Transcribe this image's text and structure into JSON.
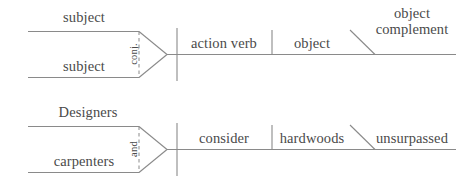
{
  "colors": {
    "line": "#8a8a8a",
    "text": "#4a4a4a",
    "background": "#ffffff"
  },
  "diagrams": [
    {
      "id": "template-diagram",
      "name": "generic-pattern",
      "subject_top": "subject",
      "subject_bottom": "subject",
      "conjunction": "conj.",
      "verb": "action verb",
      "object": "object",
      "complement_line1": "object",
      "complement_line2": "complement"
    },
    {
      "id": "example-diagram",
      "name": "example-sentence",
      "subject_top": "Designers",
      "subject_bottom": "carpenters",
      "conjunction": "and",
      "verb": "consider",
      "object": "hardwoods",
      "complement_line1": "unsurpassed",
      "complement_line2": ""
    }
  ]
}
